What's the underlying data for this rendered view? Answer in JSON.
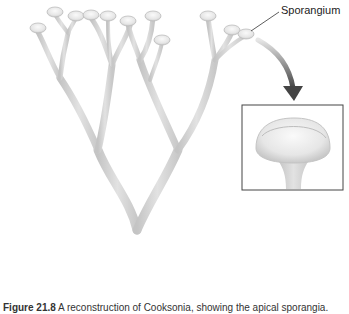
{
  "figure": {
    "label": "Sporangium",
    "caption_number": "Figure 21.8",
    "caption_text": "A reconstruction of Cooksonia, showing the apical sporangia.",
    "colors": {
      "stem": "#d6d6d6",
      "stem_edge": "#b9b9b9",
      "sporangium": "#ececec",
      "sporangium_edge": "#bdbdbd",
      "arrow": "#555555",
      "inset_border": "#444444",
      "leader_line": "#333333"
    }
  }
}
